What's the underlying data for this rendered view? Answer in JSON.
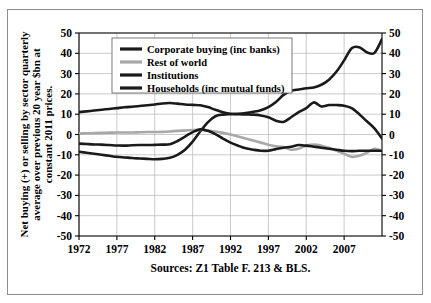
{
  "chart_data": {
    "type": "line",
    "title": "",
    "subtitle": "",
    "xlabel": "",
    "ylabel": "Net buying (+) or selling by sector quarterly average over previous 20 year $bn at constant 2011 prices.",
    "source": "Sources: Z1 Table F. 213 & BLS.",
    "xlim": [
      1972,
      2012
    ],
    "ylim": [
      -50,
      50
    ],
    "xticks": [
      1972,
      1977,
      1982,
      1987,
      1992,
      1997,
      2002,
      2007
    ],
    "yticks": [
      50,
      40,
      30,
      20,
      10,
      0,
      -10,
      -20,
      -30,
      -40,
      -50
    ],
    "y_right_ticks": [
      50,
      40,
      30,
      20,
      10,
      0,
      -10,
      -20,
      -30,
      -40,
      -50
    ],
    "grid": true,
    "legend_position": "top-left-inside",
    "x": [
      1972,
      1973,
      1974,
      1975,
      1976,
      1977,
      1978,
      1979,
      1980,
      1981,
      1982,
      1983,
      1984,
      1985,
      1986,
      1987,
      1988,
      1989,
      1990,
      1991,
      1992,
      1993,
      1994,
      1995,
      1996,
      1997,
      1998,
      1999,
      2000,
      2001,
      2002,
      2003,
      2004,
      2005,
      2006,
      2007,
      2008,
      2009,
      2010,
      2011,
      2012
    ],
    "series": [
      {
        "name": "Corporate buying (inc banks)",
        "color": "#1a1a1a",
        "width": 2.6,
        "values": [
          -8.5,
          -9.0,
          -9.5,
          -10.0,
          -10.5,
          -11.0,
          -11.3,
          -11.6,
          -11.8,
          -12.0,
          -12.2,
          -12.0,
          -11.5,
          -10.0,
          -7.5,
          -3.5,
          1.5,
          6.0,
          9.0,
          9.8,
          10.0,
          10.2,
          10.6,
          11.2,
          12.0,
          13.5,
          16.0,
          19.5,
          21.5,
          22.2,
          22.8,
          23.2,
          24.5,
          27.0,
          31.0,
          36.5,
          42.5,
          43.0,
          40.5,
          40.2,
          47.0
        ]
      },
      {
        "name": "Rest of world",
        "color": "#a8a8a8",
        "width": 2.6,
        "values": [
          0.5,
          0.6,
          0.7,
          0.8,
          0.9,
          1.0,
          1.0,
          1.0,
          1.1,
          1.2,
          1.2,
          1.3,
          1.5,
          1.8,
          2.0,
          2.2,
          2.2,
          2.0,
          1.5,
          0.8,
          0.0,
          -1.0,
          -2.0,
          -3.0,
          -4.0,
          -5.0,
          -5.8,
          -6.2,
          -7.5,
          -7.0,
          -5.5,
          -5.0,
          -5.5,
          -6.5,
          -8.0,
          -9.5,
          -11.0,
          -10.5,
          -9.0,
          -7.0,
          -8.0
        ]
      },
      {
        "name": "Institutions",
        "color": "#1a1a1a",
        "width": 2.6,
        "values": [
          11.0,
          11.4,
          11.8,
          12.2,
          12.6,
          13.0,
          13.4,
          13.7,
          14.0,
          14.4,
          14.8,
          15.3,
          15.5,
          15.2,
          14.8,
          14.6,
          14.4,
          13.5,
          12.2,
          11.0,
          10.2,
          10.0,
          9.9,
          9.8,
          9.4,
          8.5,
          6.8,
          6.2,
          8.5,
          11.0,
          13.0,
          15.8,
          13.8,
          14.5,
          14.5,
          14.2,
          13.0,
          10.0,
          6.5,
          3.0,
          -2.0
        ]
      },
      {
        "name": "Households (inc mutual funds)",
        "color": "#1a1a1a",
        "width": 2.6,
        "values": [
          -4.5,
          -4.7,
          -4.9,
          -5.0,
          -5.2,
          -5.4,
          -5.5,
          -5.3,
          -5.2,
          -5.2,
          -5.1,
          -5.0,
          -4.8,
          -3.2,
          -1.0,
          1.2,
          2.5,
          1.8,
          0.2,
          -2.0,
          -4.0,
          -5.5,
          -6.8,
          -7.5,
          -8.0,
          -8.0,
          -7.2,
          -6.5,
          -6.0,
          -5.2,
          -5.5,
          -6.0,
          -6.5,
          -7.0,
          -7.5,
          -8.0,
          -8.2,
          -8.0,
          -8.0,
          -8.0,
          -8.0
        ]
      }
    ]
  },
  "legend": {
    "items": [
      {
        "label": "Corporate buying (inc banks)",
        "swatch_color": "#1a1a1a"
      },
      {
        "label": "Rest of world",
        "swatch_color": "#a8a8a8"
      },
      {
        "label": "Institutions",
        "swatch_color": "#1a1a1a"
      },
      {
        "label": "Households (inc mutual funds)",
        "swatch_color": "#1a1a1a"
      }
    ]
  },
  "axes": {
    "y_title": "Net buying (+) or selling by sector quarterly average over previous 20 year $bn at constant 2011 prices.",
    "x_tick_labels": [
      "1972",
      "1977",
      "1982",
      "1987",
      "1992",
      "1997",
      "2002",
      "2007"
    ],
    "y_tick_labels_left": [
      "50",
      "40",
      "30",
      "20",
      "10",
      "0",
      "-10",
      "-20",
      "-30",
      "-40",
      "-50"
    ],
    "y_tick_labels_right": [
      "50",
      "40",
      "30",
      "20",
      "10",
      "0",
      "-10",
      "-20",
      "-30",
      "-40",
      "-50"
    ]
  },
  "caption": {
    "source_text": "Sources: Z1 Table F. 213 & BLS."
  },
  "style": {
    "frame_color": "#8d8d8d",
    "grid_color": "#b4b4b4",
    "axis_color": "#000000",
    "background": "#ffffff"
  }
}
